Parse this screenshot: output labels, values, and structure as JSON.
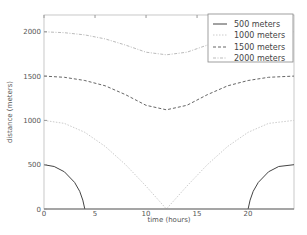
{
  "chart_data": {
    "type": "line",
    "title": "",
    "xlabel": "time (hours)",
    "ylabel": "distance (meters)",
    "xlim": [
      0,
      24.5
    ],
    "ylim": [
      0,
      2250
    ],
    "xticks": [
      0,
      5,
      10,
      15,
      20
    ],
    "yticks": [
      0,
      500,
      1000,
      1500,
      2000
    ],
    "grid": false,
    "legend_position": "upper right",
    "series": [
      {
        "name": "500 meters",
        "style": "solid",
        "color": "#444444",
        "segments": [
          {
            "x": [
              0,
              1,
              2,
              3,
              3.5,
              3.8,
              4.0
            ],
            "y": [
              500,
              480,
              420,
              300,
              200,
              100,
              0
            ]
          },
          {
            "x": [
              20.0,
              20.2,
              20.5,
              21,
              22,
              23,
              24.5
            ],
            "y": [
              0,
              100,
              200,
              300,
              420,
              480,
              500
            ]
          }
        ]
      },
      {
        "name": "1000 meters",
        "style": "dotted-light",
        "color": "#cccccc",
        "x": [
          0,
          2,
          4,
          6,
          8,
          10,
          12,
          14,
          16,
          18,
          20,
          22,
          24.5
        ],
        "y": [
          1000,
          966,
          866,
          707,
          500,
          259,
          0,
          259,
          500,
          707,
          866,
          966,
          1000
        ]
      },
      {
        "name": "1500 meters",
        "style": "dashed",
        "color": "#666666",
        "x": [
          0,
          2,
          4,
          6,
          8,
          10,
          12,
          14,
          16,
          18,
          20,
          22,
          24.5
        ],
        "y": [
          1500,
          1487,
          1450,
          1390,
          1290,
          1170,
          1120,
          1170,
          1290,
          1390,
          1450,
          1487,
          1500
        ]
      },
      {
        "name": "2000 meters",
        "style": "dash-dot-light",
        "color": "#bbbbbb",
        "x": [
          0,
          2,
          4,
          6,
          8,
          10,
          12,
          14,
          16,
          18,
          20,
          22,
          24.5
        ],
        "y": [
          2000,
          1990,
          1965,
          1920,
          1850,
          1770,
          1740,
          1770,
          1850,
          1920,
          1965,
          1990,
          2000
        ]
      }
    ]
  },
  "legend": {
    "items": [
      "500 meters",
      "1000 meters",
      "1500 meters",
      "2000 meters"
    ]
  },
  "axes": {
    "xlabel": "time (hours)",
    "ylabel": "distance (meters)",
    "xtick_labels": [
      "0",
      "5",
      "10",
      "15",
      "20"
    ],
    "ytick_labels": [
      "0",
      "500",
      "1000",
      "1500",
      "2000"
    ]
  }
}
